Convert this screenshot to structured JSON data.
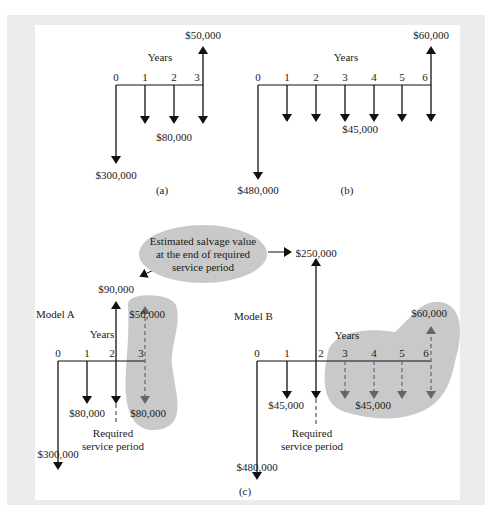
{
  "figure": {
    "panels": [
      {
        "id": "a",
        "caption": "(a)",
        "axis_label": "Years",
        "periods": [
          "0",
          "1",
          "2",
          "3"
        ],
        "cash_flows": [
          {
            "year": 0,
            "direction": "down",
            "amount": "$300,000"
          },
          {
            "year": 1,
            "direction": "down",
            "amount": "$80,000"
          },
          {
            "year": 2,
            "direction": "down",
            "amount": "$80,000"
          },
          {
            "year": 3,
            "direction": "down",
            "amount": "$80,000"
          },
          {
            "year": 3,
            "direction": "up",
            "amount": "$50,000"
          }
        ],
        "labels": {
          "recurring": "$80,000",
          "initial": "$300,000",
          "salvage": "$50,000"
        }
      },
      {
        "id": "b",
        "caption": "(b)",
        "axis_label": "Years",
        "periods": [
          "0",
          "1",
          "2",
          "3",
          "4",
          "5",
          "6"
        ],
        "cash_flows": [
          {
            "year": 0,
            "direction": "down",
            "amount": "$480,000"
          },
          {
            "year": 1,
            "direction": "down",
            "amount": "$45,000"
          },
          {
            "year": 2,
            "direction": "down",
            "amount": "$45,000"
          },
          {
            "year": 3,
            "direction": "down",
            "amount": "$45,000"
          },
          {
            "year": 4,
            "direction": "down",
            "amount": "$45,000"
          },
          {
            "year": 5,
            "direction": "down",
            "amount": "$45,000"
          },
          {
            "year": 6,
            "direction": "down",
            "amount": "$45,000"
          },
          {
            "year": 6,
            "direction": "up",
            "amount": "$60,000"
          }
        ],
        "labels": {
          "recurring": "$45,000",
          "initial": "$480,000",
          "salvage": "$60,000"
        }
      },
      {
        "id": "c",
        "caption": "(c)",
        "callout": {
          "line1": "Estimated salvage value",
          "line2": "at the end of required",
          "line3": "service period"
        },
        "model_a": {
          "title": "Model A",
          "axis_label": "Years",
          "periods": [
            "0",
            "1",
            "2",
            "3"
          ],
          "initial": "$300,000",
          "recurring_left": "$80,000",
          "recurring_right": "$80,000",
          "salvage_at_service_end": "$90,000",
          "original_salvage": "$50,000",
          "required_service_line1": "Required",
          "required_service_line2": "service period"
        },
        "model_b": {
          "title": "Model B",
          "axis_label": "Years",
          "periods": [
            "0",
            "1",
            "2",
            "3",
            "4",
            "5",
            "6"
          ],
          "initial": "$480,000",
          "recurring_left": "$45,000",
          "recurring_right": "$45,000",
          "salvage_at_service_end": "$250,000",
          "original_salvage": "$60,000",
          "required_service_line1": "Required",
          "required_service_line2": "service period"
        }
      }
    ],
    "colors": {
      "frame": "#ececec",
      "panel": "#ffffff",
      "shaded_region": "#c9c9c9",
      "solid_arrow": "#111111",
      "dashed_arrow": "#555555"
    }
  }
}
